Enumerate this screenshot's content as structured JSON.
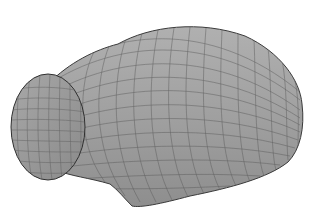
{
  "scene": {
    "subject": "3D wireframe-shaded surface mesh of a bulbous, nose-cone-like body with an elliptical open end",
    "background_color": "#ffffff",
    "surface_color": "#9a9a9a",
    "surface_highlight": "#b2b2b2",
    "mesh_line_color": "#5a5a5a",
    "outline_color": "#3a3a3a"
  }
}
